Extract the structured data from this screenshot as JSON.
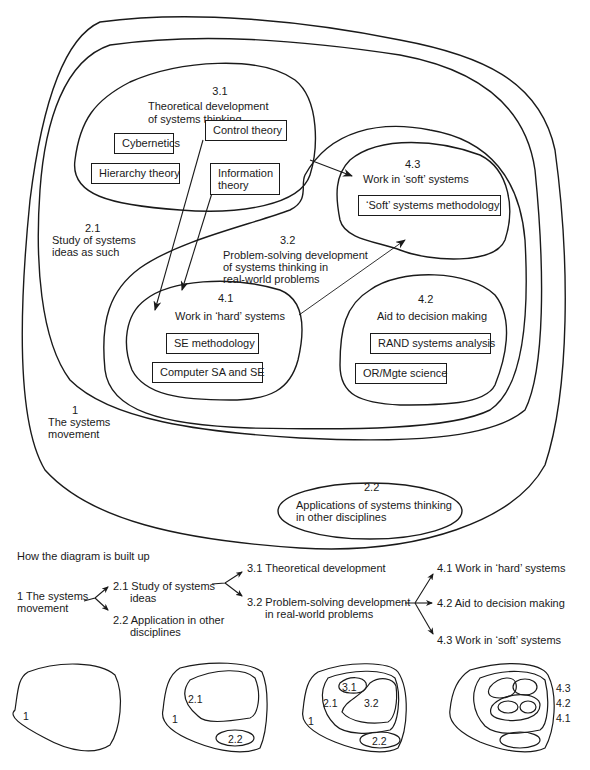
{
  "main_diagram": {
    "regions": [
      {
        "id": "1",
        "number": "1",
        "label": "The systems movement",
        "lines": [
          "The systems",
          "movement"
        ]
      },
      {
        "id": "2.1",
        "number": "2.1",
        "label": "Study of systems ideas as such",
        "lines": [
          "Study of systems",
          "ideas as such"
        ]
      },
      {
        "id": "2.2",
        "number": "2.2",
        "label": "Applications of systems thinking in other disciplines",
        "lines": [
          "Applications of systems thinking",
          "in other disciplines"
        ]
      },
      {
        "id": "3.1",
        "number": "3.1",
        "label": "Theoretical development of systems thinking",
        "lines": [
          "Theoretical development",
          "of systems thinking"
        ]
      },
      {
        "id": "3.2",
        "number": "3.2",
        "label": "Problem-solving development of systems thinking in real-world problems",
        "lines": [
          "Problem-solving development",
          "of systems thinking in",
          "real-world problems"
        ]
      },
      {
        "id": "4.1",
        "number": "4.1",
        "label": "Work in 'hard' systems",
        "lines": [
          "Work in ‘hard’ systems"
        ]
      },
      {
        "id": "4.2",
        "number": "4.2",
        "label": "Aid to decision making",
        "lines": [
          "Aid to decision making"
        ]
      },
      {
        "id": "4.3",
        "number": "4.3",
        "label": "Work in 'soft' systems",
        "lines": [
          "Work in ‘soft’ systems"
        ]
      }
    ],
    "boxes": {
      "cybernetics": "Cybernetics",
      "hierarchy_theory": "Hierarchy theory",
      "control_theory": "Control theory",
      "information_theory": [
        "Information",
        "theory"
      ],
      "soft_systems_methodology": "‘Soft’ systems methodology",
      "se_methodology": "SE methodology",
      "computer_sa_se": "Computer SA and SE",
      "rand_systems_analysis": "RAND systems analysis",
      "or_mgte_science": "OR/Mgte science"
    },
    "arrows": [
      {
        "from": "Control theory",
        "to": "4.1"
      },
      {
        "from": "Information theory",
        "to": "4.1"
      },
      {
        "from": "3.1",
        "to": "4.3"
      },
      {
        "from": "4.1",
        "to": "4.3"
      }
    ]
  },
  "build_up": {
    "title": "How the diagram is built up",
    "level1": {
      "number": "1",
      "lines": [
        "The systems",
        "movement"
      ]
    },
    "level2": [
      {
        "number": "2.1",
        "lines": [
          "Study of systems",
          "ideas"
        ]
      },
      {
        "number": "2.2",
        "lines": [
          "Application in other",
          "disciplines"
        ]
      }
    ],
    "level3": [
      {
        "number": "3.1",
        "lines": [
          "Theoretical development"
        ]
      },
      {
        "number": "3.2",
        "lines": [
          "Problem-solving development",
          "in real-world problems"
        ]
      }
    ],
    "level4": [
      {
        "number": "4.1",
        "lines": [
          "Work in ‘hard’ systems"
        ]
      },
      {
        "number": "4.2",
        "lines": [
          "Aid to decision making"
        ]
      },
      {
        "number": "4.3",
        "lines": [
          "Work in ‘soft’ systems"
        ]
      }
    ]
  },
  "thumbnails": [
    {
      "stage": 1,
      "labels": [
        "1"
      ]
    },
    {
      "stage": 2,
      "labels": [
        "2.1",
        "1",
        "2.2"
      ]
    },
    {
      "stage": 3,
      "labels": [
        "3.1",
        "2.1",
        "3.2",
        "1",
        "2.2"
      ]
    },
    {
      "stage": 4,
      "labels": [
        "4.3",
        "4.2",
        "4.1"
      ]
    }
  ],
  "colors": {
    "ink": "#1a1a1a",
    "paper": "#ffffff"
  }
}
